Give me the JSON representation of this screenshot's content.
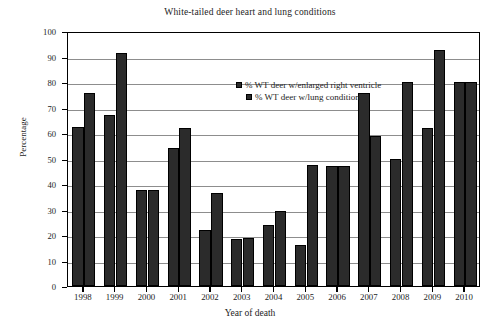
{
  "chart_data": {
    "type": "bar",
    "title": "White-tailed deer heart and lung conditions",
    "xlabel": "Year of death",
    "ylabel": "Percentage",
    "categories": [
      "1998",
      "1999",
      "2000",
      "2001",
      "2002",
      "2003",
      "2004",
      "2005",
      "2006",
      "2007",
      "2008",
      "2009",
      "2010"
    ],
    "series": [
      {
        "name": "% WT deer w/enlarged right ventricle",
        "color": "#2b2b2b",
        "values": [
          62.5,
          67,
          37.5,
          54,
          22,
          18.5,
          24,
          16,
          47,
          75.5,
          50,
          62,
          80
        ]
      },
      {
        "name": "% WT deer w/lung condition",
        "color": "#2b2b2b",
        "values": [
          75.5,
          91.5,
          37.5,
          62,
          36.5,
          19,
          29.5,
          47.5,
          47,
          59,
          80,
          92.5,
          80
        ]
      }
    ],
    "ylim": [
      0,
      100
    ],
    "y_ticks": [
      "0",
      "10",
      "20",
      "30",
      "40",
      "50",
      "60",
      "70",
      "80",
      "90",
      "100"
    ],
    "grid": true,
    "legend_position": "top-center"
  }
}
